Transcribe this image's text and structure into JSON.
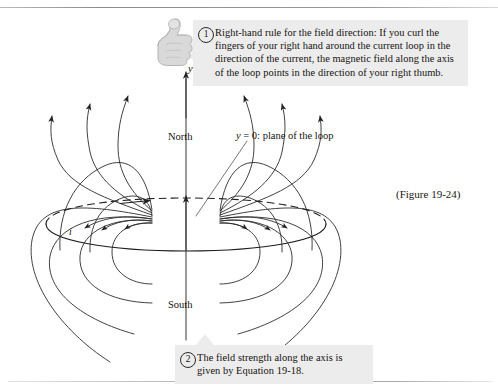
{
  "figure": {
    "caption": "(Figure 19-24)",
    "title_context": "Magnetic field of a current loop"
  },
  "callouts": [
    {
      "number": "1",
      "text": "Right-hand rule for the field direction: If you curl the fingers of your right hand around the current loop in the direction of the current, the magnetic field along the axis of the loop points in the direction of your right thumb."
    },
    {
      "number": "2",
      "text": "The field strength along the axis is given by Equation 19-18."
    }
  ],
  "diagram": {
    "axis_label": "y",
    "north_label": "North",
    "south_label": "South",
    "plane_label_prefix": "y",
    "plane_label_rest": " = 0: plane of the loop",
    "current_label": "i",
    "hand_icon": "thumbs-up-icon"
  },
  "colors": {
    "ink": "#1a1a1a",
    "callout_bg": "#ececec",
    "page_bg": "#ffffff",
    "rule": "#8c8c8c"
  }
}
